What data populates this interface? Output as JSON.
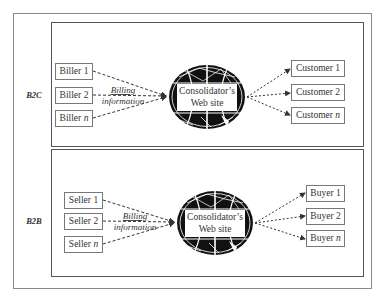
{
  "diagram": {
    "type": "flow-diagram",
    "panels": [
      {
        "id": "b2c",
        "label": "B2C",
        "sources": [
          {
            "name": "Biller",
            "suffix": "1"
          },
          {
            "name": "Biller",
            "suffix": "2"
          },
          {
            "name": "Biller",
            "suffix": "n"
          }
        ],
        "flow_label_line1": "Billing",
        "flow_label_line2": "information",
        "hub_line1": "Consolidator’s",
        "hub_line2": "Web site",
        "targets": [
          {
            "name": "Customer",
            "suffix": "1"
          },
          {
            "name": "Customer",
            "suffix": "2"
          },
          {
            "name": "Customer",
            "suffix": "n"
          }
        ]
      },
      {
        "id": "b2b",
        "label": "B2B",
        "sources": [
          {
            "name": "Seller",
            "suffix": "1"
          },
          {
            "name": "Seller",
            "suffix": "2"
          },
          {
            "name": "Seller",
            "suffix": "n"
          }
        ],
        "flow_label_line1": "Billing",
        "flow_label_line2": "information",
        "hub_line1": "Consolidator’s",
        "hub_line2": "Web site",
        "targets": [
          {
            "name": "Buyer",
            "suffix": "1"
          },
          {
            "name": "Buyer",
            "suffix": "2"
          },
          {
            "name": "Buyer",
            "suffix": "n"
          }
        ]
      }
    ],
    "colors": {
      "line": "#333333",
      "frame": "#8a8a8a",
      "globe": "#111111",
      "background": "#ffffff"
    }
  }
}
